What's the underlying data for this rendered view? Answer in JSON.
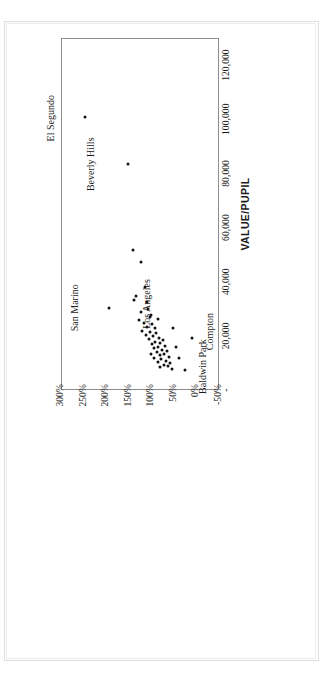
{
  "chart_data": {
    "type": "scatter",
    "title": "",
    "xlabel": "VALUE/PUPIL",
    "ylabel": "",
    "xlim": [
      0,
      130000
    ],
    "ylim": [
      -50,
      300
    ],
    "grid": "vertical",
    "legend": "none",
    "xticks": [
      {
        "value": 0,
        "label": "-"
      },
      {
        "value": 20000,
        "label": "20,000"
      },
      {
        "value": 40000,
        "label": "40,000"
      },
      {
        "value": 60000,
        "label": "60,000"
      },
      {
        "value": 80000,
        "label": "80,000"
      },
      {
        "value": 100000,
        "label": "100,000"
      },
      {
        "value": 120000,
        "label": "120,000"
      }
    ],
    "yticks": [
      {
        "value": 300,
        "label": "300%"
      },
      {
        "value": 250,
        "label": "250%"
      },
      {
        "value": 200,
        "label": "200%"
      },
      {
        "value": 150,
        "label": "150%"
      },
      {
        "value": 100,
        "label": "100%"
      },
      {
        "value": 50,
        "label": "50%"
      },
      {
        "value": 0,
        "label": "0%"
      },
      {
        "value": -50,
        "label": "-50%"
      }
    ],
    "annotations": [
      {
        "text": "El Segundo",
        "x": 100000,
        "y": 250
      },
      {
        "text": "Beverly Hills",
        "x": 83000,
        "y": 157
      },
      {
        "text": "San Marino",
        "x": 30000,
        "y": 196
      },
      {
        "text": "Los Angeles",
        "x": 25500,
        "y": 93
      },
      {
        "text": "Baldwin Park",
        "x": 10500,
        "y": 64
      },
      {
        "text": "Compton",
        "x": 19000,
        "y": 12
      }
    ],
    "points": [
      {
        "x": 100500,
        "y": 250,
        "name": "El Segundo"
      },
      {
        "x": 83000,
        "y": 153,
        "name": "Beverly Hills"
      },
      {
        "x": 30000,
        "y": 196,
        "name": "San Marino"
      },
      {
        "x": 51500,
        "y": 143,
        "name": ""
      },
      {
        "x": 47000,
        "y": 126,
        "name": ""
      },
      {
        "x": 37500,
        "y": 117,
        "name": ""
      },
      {
        "x": 33000,
        "y": 140,
        "name": ""
      },
      {
        "x": 34500,
        "y": 136,
        "name": ""
      },
      {
        "x": 32000,
        "y": 112,
        "name": ""
      },
      {
        "x": 28500,
        "y": 124,
        "name": ""
      },
      {
        "x": 26500,
        "y": 106,
        "name": ""
      },
      {
        "x": 25500,
        "y": 130,
        "name": ""
      },
      {
        "x": 24500,
        "y": 119,
        "name": ""
      },
      {
        "x": 24000,
        "y": 100,
        "name": ""
      },
      {
        "x": 23000,
        "y": 112,
        "name": ""
      },
      {
        "x": 22500,
        "y": 95,
        "name": "Los Angeles"
      },
      {
        "x": 21500,
        "y": 122,
        "name": ""
      },
      {
        "x": 21000,
        "y": 104,
        "name": ""
      },
      {
        "x": 20500,
        "y": 91,
        "name": ""
      },
      {
        "x": 20000,
        "y": 114,
        "name": ""
      },
      {
        "x": 19500,
        "y": 98,
        "name": ""
      },
      {
        "x": 19000,
        "y": 86,
        "name": ""
      },
      {
        "x": 18500,
        "y": 108,
        "name": ""
      },
      {
        "x": 18000,
        "y": 77,
        "name": ""
      },
      {
        "x": 17500,
        "y": 93,
        "name": ""
      },
      {
        "x": 17000,
        "y": 83,
        "name": ""
      },
      {
        "x": 16500,
        "y": 101,
        "name": ""
      },
      {
        "x": 16000,
        "y": 72,
        "name": ""
      },
      {
        "x": 15500,
        "y": 88,
        "name": ""
      },
      {
        "x": 15000,
        "y": 96,
        "name": ""
      },
      {
        "x": 14500,
        "y": 79,
        "name": ""
      },
      {
        "x": 14000,
        "y": 68,
        "name": ""
      },
      {
        "x": 13500,
        "y": 90,
        "name": ""
      },
      {
        "x": 13000,
        "y": 75,
        "name": ""
      },
      {
        "x": 12500,
        "y": 84,
        "name": ""
      },
      {
        "x": 12000,
        "y": 64,
        "name": "Baldwin Park"
      },
      {
        "x": 11500,
        "y": 97,
        "name": ""
      },
      {
        "x": 11000,
        "y": 80,
        "name": ""
      },
      {
        "x": 10500,
        "y": 70,
        "name": ""
      },
      {
        "x": 10000,
        "y": 88,
        "name": ""
      },
      {
        "x": 9500,
        "y": 60,
        "name": ""
      },
      {
        "x": 9000,
        "y": 74,
        "name": ""
      },
      {
        "x": 8500,
        "y": 66,
        "name": ""
      },
      {
        "x": 8000,
        "y": 82,
        "name": ""
      },
      {
        "x": 7500,
        "y": 57,
        "name": ""
      },
      {
        "x": 22500,
        "y": 55,
        "name": ""
      },
      {
        "x": 15500,
        "y": 48,
        "name": ""
      },
      {
        "x": 11500,
        "y": 40,
        "name": ""
      },
      {
        "x": 19000,
        "y": 12,
        "name": "Compton"
      },
      {
        "x": 7000,
        "y": 28,
        "name": ""
      },
      {
        "x": 27500,
        "y": 103,
        "name": ""
      },
      {
        "x": 29500,
        "y": 109,
        "name": ""
      },
      {
        "x": 26000,
        "y": 87,
        "name": ""
      },
      {
        "x": 13000,
        "y": 103,
        "name": ""
      }
    ]
  }
}
